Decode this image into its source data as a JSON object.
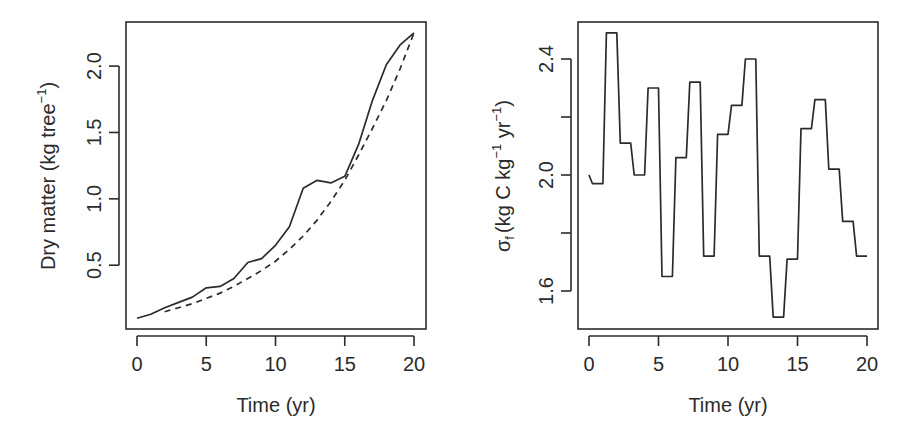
{
  "chart_data": [
    {
      "type": "line",
      "title": "",
      "xlabel": "Time (yr)",
      "ylabel": "Dry matter (kg tree⁻¹)",
      "ylabel_parts": {
        "main": "Dry matter (kg tree",
        "sup": "−1",
        "close": ")"
      },
      "xlim": [
        0,
        20
      ],
      "ylim": [
        0.03,
        2.35
      ],
      "xticks": [
        0,
        5,
        10,
        15,
        20
      ],
      "xtick_labels": [
        "0",
        "5",
        "10",
        "15",
        "20"
      ],
      "yticks": [
        0.5,
        1.0,
        1.5,
        2.0
      ],
      "ytick_labels": [
        "0.5",
        "1.0",
        "1.5",
        "2.0"
      ],
      "grid": false,
      "legend": null,
      "series": [
        {
          "name": "observed",
          "style": "solid",
          "x": [
            0,
            1,
            2,
            3,
            4,
            5,
            6,
            7,
            8,
            9,
            10,
            11,
            12,
            13,
            14,
            15,
            16,
            17,
            18,
            19,
            20
          ],
          "values": [
            0.1,
            0.13,
            0.18,
            0.22,
            0.26,
            0.33,
            0.34,
            0.4,
            0.52,
            0.55,
            0.65,
            0.79,
            1.08,
            1.14,
            1.12,
            1.17,
            1.41,
            1.74,
            2.01,
            2.16,
            2.25
          ]
        },
        {
          "name": "fitted",
          "style": "dashed",
          "x": [
            2,
            3,
            4,
            5,
            6,
            7,
            8,
            9,
            10,
            11,
            12,
            13,
            14,
            15,
            16,
            17,
            18,
            19,
            20
          ],
          "values": [
            0.15,
            0.18,
            0.21,
            0.25,
            0.29,
            0.34,
            0.4,
            0.46,
            0.53,
            0.62,
            0.72,
            0.84,
            0.98,
            1.14,
            1.33,
            1.53,
            1.74,
            1.98,
            2.25
          ]
        }
      ]
    },
    {
      "type": "line",
      "title": "",
      "xlabel": "Time (yr)",
      "ylabel": "σf (kg C kg⁻¹ yr⁻¹)",
      "ylabel_parts": {
        "sigma": "σ",
        "sub": "f",
        "a": "(kg C kg",
        "sup1": "−1",
        "b": " yr",
        "sup2": "−1",
        "close": ")"
      },
      "xlim": [
        0,
        20
      ],
      "ylim": [
        1.46,
        2.54
      ],
      "xticks": [
        0,
        5,
        10,
        15,
        20
      ],
      "xtick_labels": [
        "0",
        "5",
        "10",
        "15",
        "20"
      ],
      "yticks": [
        1.6,
        1.8,
        2.0,
        2.2,
        2.4
      ],
      "ytick_labels": [
        "1.6",
        "",
        "2.0",
        "",
        "2.4"
      ],
      "grid": false,
      "legend": null,
      "series": [
        {
          "name": "sigma_f",
          "style": "step",
          "x": [
            0,
            0.25,
            1.0,
            1.25,
            2.0,
            2.25,
            3.0,
            3.25,
            4.0,
            4.25,
            5.0,
            5.25,
            6.0,
            6.25,
            7.0,
            7.25,
            8.0,
            8.25,
            9.0,
            9.25,
            10.0,
            10.25,
            11.0,
            11.25,
            12.0,
            12.25,
            13.0,
            13.25,
            14.0,
            14.25,
            15.0,
            15.25,
            16.0,
            16.25,
            17.0,
            17.25,
            18.0,
            18.25,
            19.0,
            19.25,
            20.0
          ],
          "values": [
            2.0,
            1.97,
            1.97,
            2.49,
            2.49,
            2.11,
            2.11,
            2.0,
            2.0,
            2.3,
            2.3,
            1.65,
            1.65,
            2.06,
            2.06,
            2.32,
            2.32,
            1.72,
            1.72,
            2.14,
            2.14,
            2.24,
            2.24,
            2.4,
            2.4,
            1.72,
            1.72,
            1.51,
            1.51,
            1.71,
            1.71,
            2.16,
            2.16,
            2.26,
            2.26,
            2.02,
            2.02,
            1.84,
            1.84,
            1.72,
            1.72
          ]
        }
      ]
    }
  ]
}
